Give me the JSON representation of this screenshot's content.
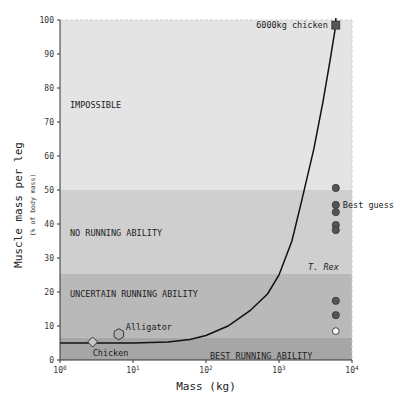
{
  "chart_data": {
    "type": "scatter",
    "title": "",
    "xlabel": "Mass (kg)",
    "ylabel": "Muscle mass per leg",
    "ylabel_sub": "(% of body mass)",
    "xscale": "log",
    "xlim": [
      1,
      10000
    ],
    "ylim": [
      0,
      100
    ],
    "grid": false,
    "x_ticks": [
      {
        "value": 1,
        "base": "10",
        "exp": "0"
      },
      {
        "value": 10,
        "base": "10",
        "exp": "1"
      },
      {
        "value": 100,
        "base": "10",
        "exp": "2"
      },
      {
        "value": 1000,
        "base": "10",
        "exp": "3"
      },
      {
        "value": 10000,
        "base": "10",
        "exp": "4"
      }
    ],
    "y_ticks": [
      0,
      10,
      20,
      30,
      40,
      50,
      60,
      70,
      80,
      90,
      100
    ],
    "bands": [
      {
        "label": "IMPOSSIBLE",
        "y0": 50,
        "y1": 100,
        "color": "#e4e4e4"
      },
      {
        "label": "NO RUNNING ABILITY",
        "y0": 25.3,
        "y1": 50,
        "color": "#cfcfcf"
      },
      {
        "label": "UNCERTAIN RUNNING ABILITY",
        "y0": 6.5,
        "y1": 25.3,
        "color": "#b9b9b9"
      },
      {
        "label": "BEST RUNNING ABILITY",
        "y0": 0,
        "y1": 6.5,
        "color": "#a6a6a6"
      }
    ],
    "curve": {
      "name": "scaled chicken",
      "points": [
        [
          1,
          5.0
        ],
        [
          10,
          5.0
        ],
        [
          30,
          5.3
        ],
        [
          60,
          6.0
        ],
        [
          100,
          7.2
        ],
        [
          200,
          10.0
        ],
        [
          400,
          14.5
        ],
        [
          700,
          19.5
        ],
        [
          1000,
          25.0
        ],
        [
          1500,
          35.0
        ],
        [
          2000,
          46.0
        ],
        [
          3000,
          62.0
        ],
        [
          4000,
          76.0
        ],
        [
          5000,
          88.0
        ],
        [
          6000,
          98.5
        ]
      ]
    },
    "series": [
      {
        "name": "Chicken",
        "marker": "diamond",
        "points": [
          [
            2.8,
            5.3
          ]
        ]
      },
      {
        "name": "Alligator",
        "marker": "hexagon",
        "points": [
          [
            6.4,
            7.6
          ]
        ]
      },
      {
        "name": "6000kg chicken",
        "marker": "square",
        "points": [
          [
            6000,
            98.5
          ]
        ]
      },
      {
        "name": "T. Rex",
        "marker": "circle",
        "points": [
          [
            6000,
            50.6
          ],
          [
            6000,
            45.6
          ],
          [
            6000,
            43.5
          ],
          [
            6000,
            39.7
          ],
          [
            6000,
            38.2
          ],
          [
            6000,
            17.4
          ],
          [
            6000,
            13.2
          ]
        ]
      },
      {
        "name": "T. Rex (hollow)",
        "marker": "circle-open",
        "points": [
          [
            6000,
            8.5
          ]
        ]
      }
    ],
    "annotations": [
      {
        "text": "6000kg chicken",
        "x": 6000,
        "y": 98.5
      },
      {
        "text": "Best guess",
        "x": 6000,
        "y": 45.6
      },
      {
        "text": "T. Rex",
        "x": 6000,
        "y": 27.5,
        "italic": true
      },
      {
        "text": "Alligator",
        "x": 6.4,
        "y": 7.6
      },
      {
        "text": "Chicken",
        "x": 2.8,
        "y": 5.3
      }
    ]
  }
}
